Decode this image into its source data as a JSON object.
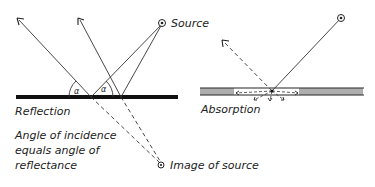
{
  "diagram": {
    "reflection": {
      "label": "Reflection",
      "source_label": "Source",
      "image_label": "Image of source",
      "angle_symbol_left": "α",
      "angle_symbol_right": "α",
      "caption_lines": [
        "Angle of incidence",
        "equals angle of",
        "reflectance"
      ]
    },
    "absorption": {
      "label": "Absorption"
    },
    "colors": {
      "ink": "#222222",
      "surface": "#111111",
      "background": "#ffffff"
    }
  }
}
